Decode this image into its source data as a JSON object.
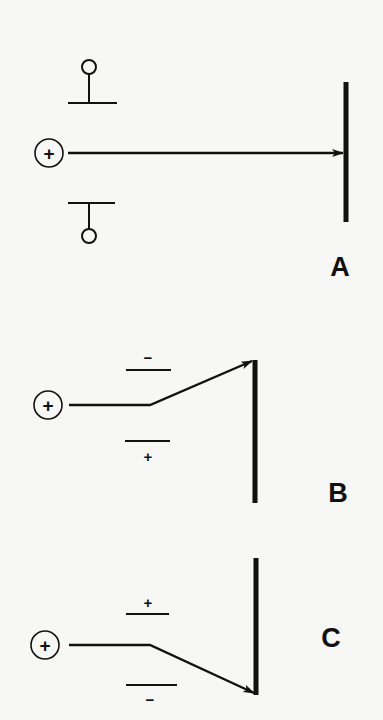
{
  "diagram": {
    "colors": {
      "background": "#f7f7f6",
      "ink": "#111111"
    },
    "panels": [
      {
        "id": "A",
        "label": "A",
        "source_symbol": "+",
        "top_plate_symbol": "terminal-circle",
        "bottom_plate_symbol": "terminal-circle",
        "top_plate_sign": "",
        "bottom_plate_sign": "",
        "deflection": "none"
      },
      {
        "id": "B",
        "label": "B",
        "source_symbol": "+",
        "top_plate_sign": "−",
        "bottom_plate_sign": "+",
        "deflection": "up"
      },
      {
        "id": "C",
        "label": "C",
        "source_symbol": "+",
        "top_plate_sign": "+",
        "bottom_plate_sign": "−",
        "deflection": "down"
      }
    ]
  }
}
